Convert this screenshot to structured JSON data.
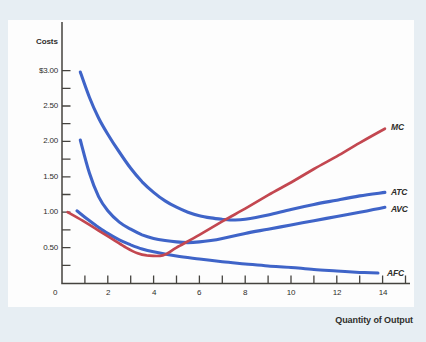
{
  "page": {
    "background": "#e7eef3",
    "panel_background": "#fdfdfd",
    "axis_color": "#45433f",
    "text_color": "#2f2e2b"
  },
  "chart_data": {
    "type": "line",
    "title": "",
    "ylabel": "Costs",
    "xlabel": "Quantity of Output",
    "xlim": [
      0,
      15.2
    ],
    "ylim": [
      0,
      3.7
    ],
    "grid": false,
    "legend_position": "end-of-line-labels",
    "x_ticks": {
      "values": [
        0,
        2,
        4,
        6,
        8,
        10,
        12,
        14
      ],
      "labels": [
        "0",
        "2",
        "4",
        "6",
        "8",
        "10",
        "12",
        "14"
      ],
      "minor_step": 1,
      "minor_max": 15
    },
    "y_ticks": {
      "values": [
        3.0,
        2.5,
        2.0,
        1.5,
        1.0,
        0.5
      ],
      "labels": [
        "$3.00",
        "2.50",
        "2.00",
        "1.50",
        "1.00",
        "0.50"
      ],
      "minor_step": 0.25,
      "minor_max": 3.0
    },
    "series": [
      {
        "name": "ATC",
        "color": "#3f64c8",
        "width": 3.1,
        "label_at": [
          14.35,
          1.285
        ],
        "points": [
          [
            0.8,
            2.98
          ],
          [
            1.2,
            2.62
          ],
          [
            1.6,
            2.33
          ],
          [
            2,
            2.1
          ],
          [
            2.5,
            1.85
          ],
          [
            3,
            1.62
          ],
          [
            3.5,
            1.43
          ],
          [
            4,
            1.28
          ],
          [
            4.5,
            1.16
          ],
          [
            5,
            1.07
          ],
          [
            5.5,
            1.0
          ],
          [
            6,
            0.95
          ],
          [
            6.5,
            0.92
          ],
          [
            7,
            0.9
          ],
          [
            7.5,
            0.89
          ],
          [
            8,
            0.9
          ],
          [
            9,
            0.96
          ],
          [
            10,
            1.04
          ],
          [
            11,
            1.11
          ],
          [
            12,
            1.17
          ],
          [
            13,
            1.23
          ],
          [
            14.1,
            1.28
          ]
        ]
      },
      {
        "name": "AVC",
        "color": "#3f64c8",
        "width": 3.1,
        "label_at": [
          14.35,
          1.05
        ],
        "points": [
          [
            0.8,
            2.02
          ],
          [
            1.2,
            1.55
          ],
          [
            1.6,
            1.22
          ],
          [
            2,
            1.02
          ],
          [
            2.5,
            0.86
          ],
          [
            3,
            0.76
          ],
          [
            3.5,
            0.68
          ],
          [
            4,
            0.63
          ],
          [
            4.5,
            0.6
          ],
          [
            5,
            0.58
          ],
          [
            5.5,
            0.57
          ],
          [
            6,
            0.58
          ],
          [
            6.5,
            0.6
          ],
          [
            7,
            0.63
          ],
          [
            8,
            0.7
          ],
          [
            9,
            0.76
          ],
          [
            10,
            0.82
          ],
          [
            11,
            0.88
          ],
          [
            12,
            0.94
          ],
          [
            13,
            1.0
          ],
          [
            14.1,
            1.07
          ]
        ]
      },
      {
        "name": "AFC",
        "color": "#3f64c8",
        "width": 3.0,
        "label_at": [
          14.2,
          0.145
        ],
        "points": [
          [
            0.65,
            1.02
          ],
          [
            1,
            0.93
          ],
          [
            1.5,
            0.81
          ],
          [
            2,
            0.7
          ],
          [
            2.5,
            0.61
          ],
          [
            3,
            0.54
          ],
          [
            3.5,
            0.48
          ],
          [
            4,
            0.44
          ],
          [
            5,
            0.38
          ],
          [
            6,
            0.34
          ],
          [
            7,
            0.3
          ],
          [
            8,
            0.27
          ],
          [
            9,
            0.24
          ],
          [
            10,
            0.22
          ],
          [
            11,
            0.19
          ],
          [
            12,
            0.17
          ],
          [
            13,
            0.15
          ],
          [
            13.8,
            0.14
          ]
        ]
      },
      {
        "name": "MC",
        "color": "#c34750",
        "width": 2.7,
        "label_at": [
          14.35,
          2.2
        ],
        "points": [
          [
            0.25,
            1.0
          ],
          [
            0.9,
            0.88
          ],
          [
            1.6,
            0.74
          ],
          [
            2.2,
            0.62
          ],
          [
            2.8,
            0.5
          ],
          [
            3.3,
            0.42
          ],
          [
            3.7,
            0.39
          ],
          [
            4.4,
            0.39
          ],
          [
            5,
            0.5
          ],
          [
            6,
            0.68
          ],
          [
            7,
            0.87
          ],
          [
            8,
            1.05
          ],
          [
            9,
            1.24
          ],
          [
            10,
            1.42
          ],
          [
            11,
            1.61
          ],
          [
            12,
            1.79
          ],
          [
            13,
            1.98
          ],
          [
            14.1,
            2.18
          ]
        ]
      }
    ]
  }
}
